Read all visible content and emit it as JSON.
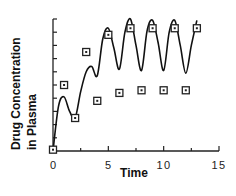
{
  "chart_data": {
    "type": "line",
    "title": "",
    "xlabel": "Time",
    "ylabel_lines": [
      "Drug  Concentration",
      "in  Plasma"
    ],
    "ylabel": "Drug Concentration in Plasma",
    "xlim": [
      0,
      15
    ],
    "ylim": [
      0,
      10
    ],
    "x_ticks": [
      0,
      5,
      10,
      15
    ],
    "x_minor_ticks": [
      2.5,
      7.5,
      12.5
    ],
    "y_ticks_count": 11,
    "y_tick_labels": [],
    "grid": false,
    "legend": null,
    "series": [
      {
        "name": "concentration curve",
        "style": "smooth line",
        "x": [
          0,
          0.5,
          1,
          1.5,
          2,
          2.5,
          3,
          3.5,
          4,
          4.5,
          5,
          5.5,
          6,
          6.5,
          7,
          7.5,
          8,
          8.5,
          9,
          9.5,
          10,
          10.5,
          11,
          11.5,
          12,
          12.5,
          13
        ],
        "values": [
          0,
          3.4,
          4.1,
          3.0,
          2.5,
          4.5,
          6.0,
          6.4,
          5.7,
          8.5,
          9.3,
          7.8,
          6.2,
          9.0,
          10.0,
          8.0,
          6.1,
          9.1,
          9.9,
          8.2,
          6.1,
          9.0,
          9.9,
          8.0,
          5.9,
          8.0,
          9.9
        ]
      },
      {
        "name": "dose markers",
        "style": "square markers",
        "x": [
          0,
          1,
          2,
          3,
          4,
          5,
          6,
          7,
          8,
          9,
          10,
          11,
          12,
          13
        ],
        "values": [
          0.1,
          5.0,
          2.5,
          7.5,
          3.8,
          8.8,
          4.4,
          9.3,
          4.6,
          9.3,
          4.6,
          9.3,
          4.6,
          9.3
        ]
      }
    ]
  },
  "labels": {
    "x_axis_title": "Time",
    "y_axis_title_line1": "Drug  Concentration",
    "y_axis_title_line2": "in  Plasma",
    "x_tick_0": "0",
    "x_tick_5": "5",
    "x_tick_10": "10",
    "x_tick_15": "15"
  },
  "colors": {
    "line": "#111111",
    "axis": "#222222",
    "marker_fill": "#ffffff",
    "marker_stroke": "#222222"
  }
}
